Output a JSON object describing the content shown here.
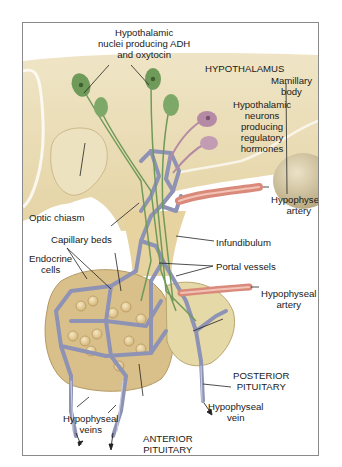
{
  "figure": {
    "type": "anatomical-illustration",
    "colors": {
      "hypothalamus_tissue": "#e9dcb4",
      "adh_neurons": "#6f9a5a",
      "regulatory_neurons": "#b58aa4",
      "capillaries": "#8e93b5",
      "arteries": "#d98a7a",
      "mamillary_body": "#cfc3a0"
    }
  },
  "labels": {
    "hypothalamic_nuclei": [
      "Hypothalamic",
      "nuclei producing ADH",
      "and oxytocin"
    ],
    "hypothalamus": "HYPOTHALAMUS",
    "mamillary_body": [
      "Mamillary",
      "body"
    ],
    "regulatory_neurons": [
      "Hypothalamic",
      "neurons",
      "producing",
      "regulatory",
      "hormones"
    ],
    "optic_chiasm": "Optic chiasm",
    "hypophyseal_artery_upper": [
      "Hypophyseal",
      "artery"
    ],
    "capillary_beds": "Capillary beds",
    "infundibulum": "Infundibulum",
    "endocrine_cells": [
      "Endocrine",
      "cells"
    ],
    "portal_vessels": "Portal vessels",
    "hypophyseal_artery_lower": [
      "Hypophyseal",
      "artery"
    ],
    "posterior_pituitary": [
      "POSTERIOR",
      "PITUITARY"
    ],
    "hypophyseal_vein": [
      "Hypophyseal",
      "vein"
    ],
    "hypophyseal_veins": [
      "Hypophyseal",
      "veins"
    ],
    "anterior_pituitary": [
      "ANTERIOR",
      "PITUITARY"
    ]
  }
}
